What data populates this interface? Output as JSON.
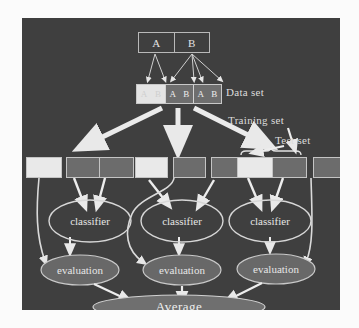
{
  "figure": {
    "background_color": "#3f3f3f",
    "page_color": "#fbfbfb",
    "stroke_color": "#dcdcdc",
    "light_cell_color": "#e9e9e9",
    "dark_cell_color": "#6c6c6c",
    "mid_cell_color": "#6e6e6e"
  },
  "top_box": {
    "name": "class-box",
    "cells": [
      {
        "label": "A"
      },
      {
        "label": "B"
      }
    ]
  },
  "data_set": {
    "label": "Data set",
    "segments": [
      {
        "shade": "light",
        "cells": [
          "A",
          "B"
        ]
      },
      {
        "shade": "mid",
        "cells": [
          "A",
          "B"
        ]
      },
      {
        "shade": "mid",
        "cells": [
          "A",
          "B"
        ]
      }
    ]
  },
  "annotations": {
    "training_set": "Training set",
    "test_set": "Test set"
  },
  "folds": [
    {
      "name": "fold-1",
      "boxes": [
        {
          "shade": "light",
          "role": "test"
        },
        {
          "shade": "dark",
          "role": "training"
        },
        {
          "shade": "dark",
          "role": "training"
        }
      ],
      "classifier": "classifier",
      "evaluation": "evaluation"
    },
    {
      "name": "fold-2",
      "boxes": [
        {
          "shade": "light",
          "role": "test"
        },
        {
          "shade": "dark",
          "role": "training"
        },
        {
          "shade": "dark",
          "role": "training"
        }
      ],
      "classifier": "classifier",
      "evaluation": "evaluation"
    },
    {
      "name": "fold-3",
      "boxes": [
        {
          "shade": "light",
          "role": "training"
        },
        {
          "shade": "dark",
          "role": "training"
        },
        {
          "shade": "dark",
          "role": "test"
        }
      ],
      "classifier": "classifier",
      "evaluation": "evaluation"
    }
  ],
  "average": {
    "label": "Average"
  }
}
